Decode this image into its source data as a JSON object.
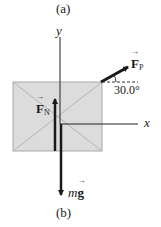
{
  "captions": {
    "top": "(a)",
    "bottom": "(b)"
  },
  "axes": {
    "y_label": "y",
    "x_label": "x"
  },
  "forces": {
    "normal": {
      "symbol": "F",
      "subscript": "N",
      "direction": "up"
    },
    "applied": {
      "symbol": "F",
      "subscript": "P",
      "angle_label": "30.0°",
      "direction": "up-right"
    },
    "weight": {
      "prefix": "m",
      "symbol": "g",
      "direction": "down"
    }
  },
  "colors": {
    "box_fill": "#dcdcdc",
    "box_stroke": "#a8a8a8",
    "vector": "#1a1a1a",
    "axis": "#222222"
  }
}
